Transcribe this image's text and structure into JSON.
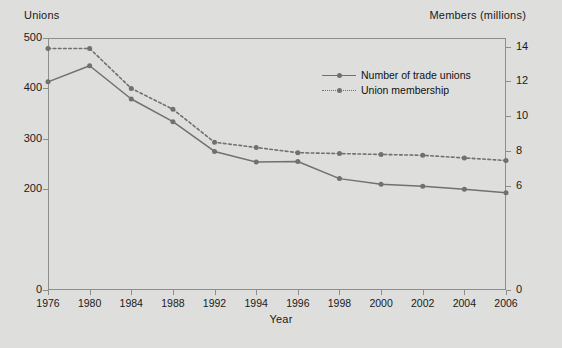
{
  "chart_data": {
    "type": "line",
    "title": "",
    "xlabel": "Year",
    "ylabel": "Unions",
    "y2label": "Members (millions)",
    "categories": [
      "1976",
      "1980",
      "1984",
      "1988",
      "1992",
      "1994",
      "1996",
      "1998",
      "2000",
      "2002",
      "2004",
      "2006"
    ],
    "ylim": [
      0,
      500
    ],
    "yticks": [
      0,
      200,
      300,
      400,
      500
    ],
    "y2lim": [
      0,
      14.5
    ],
    "y2ticks": [
      0,
      6,
      8,
      10,
      12,
      14
    ],
    "grid": false,
    "legend_position": "upper-right-inside",
    "series": [
      {
        "name": "Number of trade unions",
        "axis": "left",
        "style": "solid",
        "color": "#6f7072",
        "values": [
          413,
          445,
          379,
          334,
          275,
          254,
          255,
          221,
          210,
          206,
          200,
          193
        ]
      },
      {
        "name": "Union membership",
        "axis": "right",
        "style": "dotted",
        "color": "#6f7072",
        "values": [
          13.9,
          13.9,
          11.6,
          10.4,
          8.5,
          8.2,
          7.9,
          7.85,
          7.8,
          7.75,
          7.6,
          7.45
        ]
      }
    ]
  },
  "axes": {
    "left_title": "Unions",
    "right_title": "Members (millions)",
    "x_title": "Year",
    "left_ticks": [
      "500",
      "400",
      "300",
      "200",
      "0"
    ],
    "right_ticks": [
      "14",
      "12",
      "10",
      "8",
      "6",
      "0"
    ],
    "x_ticks": [
      "1976",
      "1980",
      "1984",
      "1988",
      "1992",
      "1994",
      "1996",
      "1998",
      "2000",
      "2002",
      "2004",
      "2006"
    ]
  },
  "legend": {
    "items": [
      {
        "label": "Number of trade unions",
        "style": "solid"
      },
      {
        "label": "Union membership",
        "style": "dotted"
      }
    ]
  },
  "colors": {
    "background": "#dededc",
    "frame": "#8d8d8d",
    "series": "#6f7072",
    "text": "#1a1a1a"
  }
}
